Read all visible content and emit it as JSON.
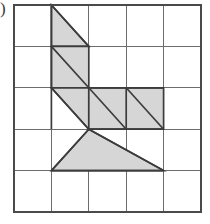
{
  "figure": {
    "label": ")",
    "type": "geometry-grid-figure",
    "colors": {
      "shade_fill": "#d6d6d6",
      "shape_outline": "#3c3c3c",
      "grid_line": "#6d6d6d",
      "grid_border": "#4a4a4a",
      "background": "#ffffff"
    },
    "grid": {
      "columns": 5,
      "rows": 5,
      "x_lines": [
        14,
        51.4,
        88.8,
        126.2,
        163.6,
        201
      ],
      "y_lines": [
        5,
        46.4,
        87.8,
        129.2,
        170.6,
        212
      ]
    },
    "shapes": [
      {
        "name": "top-triangle-r1c2",
        "points": "51.4,5 88.8,46.4 51.4,46.4"
      },
      {
        "name": "parallelogram-r2c2",
        "points": "51.4,46.4 88.8,46.4 88.8,87.8 51.4,87.8"
      },
      {
        "name": "triangle-r3c2-upper",
        "points": "51.4,87.8 88.8,87.8 88.8,129.2"
      },
      {
        "name": "band-r3c3-c4",
        "points": "88.8,87.8 163.6,87.8 163.6,129.2 88.8,129.2"
      },
      {
        "name": "bottom-triangle-r4",
        "points": "88.8,129.2 163.6,170.6 51.4,170.6"
      }
    ],
    "shape_edges": [
      {
        "name": "diag-r1c2",
        "x1": 51.4,
        "y1": 5,
        "x2": 88.8,
        "y2": 46.4
      },
      {
        "name": "diag-r2c2",
        "x1": 51.4,
        "y1": 46.4,
        "x2": 88.8,
        "y2": 87.8
      },
      {
        "name": "diag-r3c2",
        "x1": 51.4,
        "y1": 87.8,
        "x2": 88.8,
        "y2": 129.2
      },
      {
        "name": "diag-r3c3",
        "x1": 88.8,
        "y1": 87.8,
        "x2": 126.2,
        "y2": 129.2
      },
      {
        "name": "diag-r3c4",
        "x1": 126.2,
        "y1": 87.8,
        "x2": 163.6,
        "y2": 129.2
      },
      {
        "name": "left-leg-bottom",
        "x1": 88.8,
        "y1": 129.2,
        "x2": 51.4,
        "y2": 170.6
      },
      {
        "name": "right-leg-bottom",
        "x1": 88.8,
        "y1": 129.2,
        "x2": 163.6,
        "y2": 170.6
      },
      {
        "name": "vert-r1r3-c2",
        "x1": 51.4,
        "y1": 5,
        "x2": 51.4,
        "y2": 129.2
      },
      {
        "name": "vert-r3-c4",
        "x1": 126.2,
        "y1": 87.8,
        "x2": 126.2,
        "y2": 129.2
      },
      {
        "name": "horiz-base-bottom",
        "x1": 51.4,
        "y1": 170.6,
        "x2": 163.6,
        "y2": 170.6
      },
      {
        "name": "horiz-top-band",
        "x1": 88.8,
        "y1": 87.8,
        "x2": 163.6,
        "y2": 87.8
      },
      {
        "name": "horiz-bottom-band",
        "x1": 88.8,
        "y1": 129.2,
        "x2": 163.6,
        "y2": 129.2
      }
    ]
  }
}
